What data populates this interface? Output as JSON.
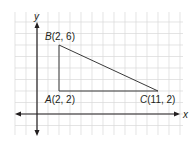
{
  "diagram": {
    "type": "coordinate-plane-triangle",
    "axes": {
      "x_label": "x",
      "y_label": "y",
      "grid": true,
      "x_range": [
        -2,
        13
      ],
      "y_range": [
        -2,
        9
      ]
    },
    "points": [
      {
        "name": "A",
        "coords": "(2, 2)",
        "x": 2,
        "y": 2
      },
      {
        "name": "B",
        "coords": "(2, 6)",
        "x": 2,
        "y": 6
      },
      {
        "name": "C",
        "coords": "(11, 2)",
        "x": 11,
        "y": 2
      }
    ],
    "colors": {
      "grid": "#d9d9d9",
      "axis": "#231f20",
      "triangle": "#3a3a3a",
      "text": "#231f20"
    }
  }
}
